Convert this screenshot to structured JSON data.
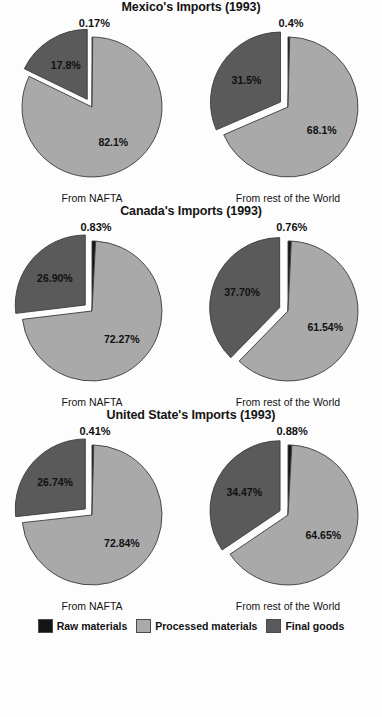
{
  "legend": {
    "items": [
      {
        "label": "Raw materials",
        "color": "#151515",
        "key": "raw"
      },
      {
        "label": "Processed materials",
        "color": "#a9a9a9",
        "key": "processed"
      },
      {
        "label": "Final goods",
        "color": "#5a5a5a",
        "key": "final"
      }
    ]
  },
  "captions": {
    "nafta": "From NAFTA",
    "world": "From rest of the World"
  },
  "panels": [
    {
      "id": "mexico",
      "title": "Mexico's Imports (1993)",
      "charts": [
        {
          "id": "mexico-nafta",
          "caption": "From NAFTA",
          "labels": {
            "raw": "0.17%",
            "processed": "82.1%",
            "final": "17.8%"
          }
        },
        {
          "id": "mexico-world",
          "caption": "From rest of the World",
          "labels": {
            "raw": "0.4%",
            "processed": "68.1%",
            "final": "31.5%"
          }
        }
      ]
    },
    {
      "id": "canada",
      "title": "Canada's Imports (1993)",
      "charts": [
        {
          "id": "canada-nafta",
          "caption": "From NAFTA",
          "labels": {
            "raw": "0.83%",
            "processed": "72.27%",
            "final": "26.90%"
          }
        },
        {
          "id": "canada-world",
          "caption": "From rest of the World",
          "labels": {
            "raw": "0.76%",
            "processed": "61.54%",
            "final": "37.70%"
          }
        }
      ]
    },
    {
      "id": "usa",
      "title": "United State's Imports (1993)",
      "charts": [
        {
          "id": "usa-nafta",
          "caption": "From NAFTA",
          "labels": {
            "raw": "0.41%",
            "processed": "72.84%",
            "final": "26.74%"
          }
        },
        {
          "id": "usa-world",
          "caption": "From rest of the World",
          "labels": {
            "raw": "0.88%",
            "processed": "64.65%",
            "final": "34.47%"
          }
        }
      ]
    }
  ],
  "chart_data": {
    "type": "pie",
    "categories": [
      "Raw materials",
      "Processed materials",
      "Final goods"
    ],
    "colors": {
      "Raw materials": "#151515",
      "Processed materials": "#a9a9a9",
      "Final goods": "#5a5a5a"
    },
    "legend_position": "bottom",
    "value_unit": "percent",
    "charts": [
      {
        "panel": "Mexico's Imports (1993)",
        "source": "From NAFTA",
        "values": [
          0.17,
          82.1,
          17.8
        ],
        "labels": [
          "0.17%",
          "82.1%",
          "17.8%"
        ],
        "exploded": [
          "Final goods"
        ]
      },
      {
        "panel": "Mexico's Imports (1993)",
        "source": "From rest of the World",
        "values": [
          0.4,
          68.1,
          31.5
        ],
        "labels": [
          "0.4%",
          "68.1%",
          "31.5%"
        ],
        "exploded": [
          "Final goods"
        ]
      },
      {
        "panel": "Canada's Imports (1993)",
        "source": "From NAFTA",
        "values": [
          0.83,
          72.27,
          26.9
        ],
        "labels": [
          "0.83%",
          "72.27%",
          "26.90%"
        ],
        "exploded": [
          "Final goods"
        ]
      },
      {
        "panel": "Canada's Imports (1993)",
        "source": "From rest of the World",
        "values": [
          0.76,
          61.54,
          37.7
        ],
        "labels": [
          "0.76%",
          "61.54%",
          "37.70%"
        ],
        "exploded": [
          "Final goods"
        ]
      },
      {
        "panel": "United State's Imports (1993)",
        "source": "From NAFTA",
        "values": [
          0.41,
          72.84,
          26.74
        ],
        "labels": [
          "0.41%",
          "72.84%",
          "26.74%"
        ],
        "exploded": [
          "Final goods"
        ]
      },
      {
        "panel": "United State's Imports (1993)",
        "source": "From rest of the World",
        "values": [
          0.88,
          64.65,
          34.47
        ],
        "labels": [
          "0.88%",
          "64.65%",
          "34.47%"
        ],
        "exploded": [
          "Final goods"
        ]
      }
    ]
  }
}
